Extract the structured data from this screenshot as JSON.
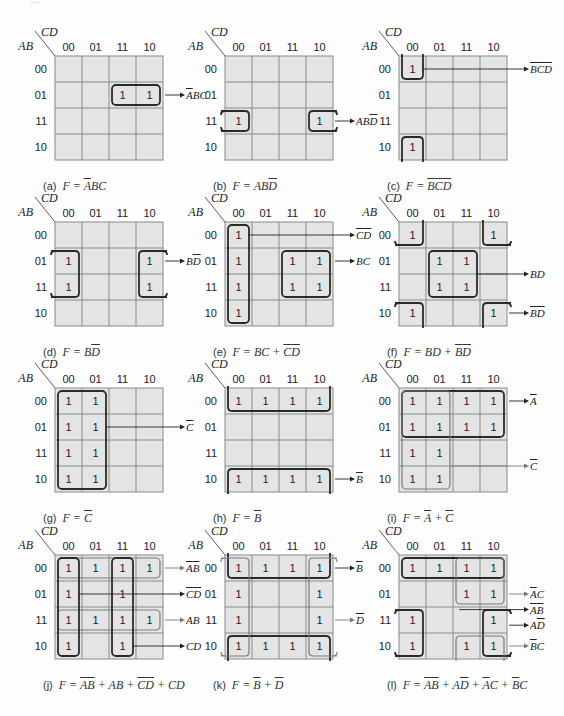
{
  "axis": {
    "row_var": "AB",
    "col_var": "CD",
    "gray_code": [
      "00",
      "01",
      "11",
      "10"
    ]
  },
  "colors": {
    "cell_fill": "#e4e4e4",
    "grid_line": "#8a8a8a",
    "loop_dark": "#2a2a2a",
    "loop_light": "#7a7a7a",
    "text": "#222222"
  },
  "layout": {
    "col_x": [
      55,
      225,
      399
    ],
    "row_y": [
      56,
      222,
      388,
      555
    ],
    "cell_w": 27,
    "cell_h": 26
  },
  "maps": [
    {
      "id": "a",
      "tag": "(a)",
      "caption": "F = [A]BC",
      "ones": [
        [
          1,
          2
        ],
        [
          1,
          3
        ]
      ],
      "loops": [
        {
          "r0": 1,
          "c0": 2,
          "r1": 1,
          "c1": 3,
          "style": "dark"
        }
      ],
      "terms": [
        {
          "label": "[A]BC",
          "ay": 1,
          "from": "right"
        }
      ]
    },
    {
      "id": "b",
      "tag": "(b)",
      "caption": "F = AB[D]",
      "ones": [
        [
          2,
          0
        ],
        [
          2,
          3
        ]
      ],
      "loops": [
        {
          "r0": 2,
          "c0": 0,
          "r1": 2,
          "c1": 0,
          "style": "dark",
          "openLeft": true
        },
        {
          "r0": 2,
          "c0": 3,
          "r1": 2,
          "c1": 3,
          "style": "dark",
          "openRight": true
        }
      ],
      "terms": [
        {
          "label": "AB[D]",
          "ay": 2,
          "from": "right"
        }
      ]
    },
    {
      "id": "c",
      "tag": "(c)",
      "caption": "F = [B][C][D]",
      "ones": [
        [
          0,
          0
        ],
        [
          3,
          0
        ]
      ],
      "loops": [
        {
          "r0": 0,
          "c0": 0,
          "r1": 0,
          "c1": 0,
          "style": "dark",
          "openTop": true
        },
        {
          "r0": 3,
          "c0": 0,
          "r1": 3,
          "c1": 0,
          "style": "dark",
          "openBottom": true
        }
      ],
      "terms": [
        {
          "label": "[B][C][D]",
          "ay": 0,
          "fromCol": 0
        }
      ]
    },
    {
      "id": "d",
      "tag": "(d)",
      "caption": "F = B[D]",
      "ones": [
        [
          1,
          0
        ],
        [
          2,
          0
        ],
        [
          1,
          3
        ],
        [
          2,
          3
        ]
      ],
      "loops": [
        {
          "r0": 1,
          "c0": 0,
          "r1": 2,
          "c1": 0,
          "style": "dark",
          "openLeft": true
        },
        {
          "r0": 1,
          "c0": 3,
          "r1": 2,
          "c1": 3,
          "style": "dark",
          "openRight": true
        }
      ],
      "terms": [
        {
          "label": "B[D]",
          "ay": 1,
          "from": "right"
        }
      ]
    },
    {
      "id": "e",
      "tag": "(e)",
      "caption": "F = BC + [C][D]",
      "ones": [
        [
          0,
          0
        ],
        [
          1,
          0
        ],
        [
          2,
          0
        ],
        [
          3,
          0
        ],
        [
          1,
          2
        ],
        [
          1,
          3
        ],
        [
          2,
          2
        ],
        [
          2,
          3
        ]
      ],
      "loops": [
        {
          "r0": 0,
          "c0": 0,
          "r1": 3,
          "c1": 0,
          "style": "dark"
        },
        {
          "r0": 1,
          "c0": 2,
          "r1": 2,
          "c1": 3,
          "style": "dark"
        }
      ],
      "terms": [
        {
          "label": "[C][D]",
          "ay": 0,
          "fromCol": 0
        },
        {
          "label": "BC",
          "ay": 1,
          "from": "right"
        }
      ]
    },
    {
      "id": "f",
      "tag": "(f)",
      "caption": "F = BD + [B][D]",
      "ones": [
        [
          0,
          0
        ],
        [
          0,
          3
        ],
        [
          1,
          1
        ],
        [
          1,
          2
        ],
        [
          2,
          1
        ],
        [
          2,
          2
        ],
        [
          3,
          0
        ],
        [
          3,
          3
        ]
      ],
      "loops": [
        {
          "r0": 0,
          "c0": 0,
          "r1": 0,
          "c1": 0,
          "style": "dark",
          "openLeft": true,
          "openTop": true
        },
        {
          "r0": 0,
          "c0": 3,
          "r1": 0,
          "c1": 3,
          "style": "dark",
          "openRight": true,
          "openTop": true
        },
        {
          "r0": 3,
          "c0": 0,
          "r1": 3,
          "c1": 0,
          "style": "dark",
          "openLeft": true,
          "openBottom": true
        },
        {
          "r0": 3,
          "c0": 3,
          "r1": 3,
          "c1": 3,
          "style": "dark",
          "openRight": true,
          "openBottom": true
        },
        {
          "r0": 1,
          "c0": 1,
          "r1": 2,
          "c1": 2,
          "style": "dark"
        }
      ],
      "terms": [
        {
          "label": "BD",
          "ay": 1.5,
          "from": "right",
          "fromX": 2
        },
        {
          "label": "[B][D]",
          "ay": 3,
          "from": "right"
        }
      ]
    },
    {
      "id": "g",
      "tag": "(g)",
      "caption": "F = [C]",
      "ones": [
        [
          0,
          0
        ],
        [
          0,
          1
        ],
        [
          1,
          0
        ],
        [
          1,
          1
        ],
        [
          2,
          0
        ],
        [
          2,
          1
        ],
        [
          3,
          0
        ],
        [
          3,
          1
        ]
      ],
      "loops": [
        {
          "r0": 0,
          "c0": 0,
          "r1": 3,
          "c1": 1,
          "style": "dark"
        }
      ],
      "terms": [
        {
          "label": "[C]",
          "ay": 1,
          "fromX": 1
        }
      ]
    },
    {
      "id": "h",
      "tag": "(h)",
      "caption": "F = [B]",
      "ones": [
        [
          0,
          0
        ],
        [
          0,
          1
        ],
        [
          0,
          2
        ],
        [
          0,
          3
        ],
        [
          3,
          0
        ],
        [
          3,
          1
        ],
        [
          3,
          2
        ],
        [
          3,
          3
        ]
      ],
      "loops": [
        {
          "r0": 0,
          "c0": 0,
          "r1": 0,
          "c1": 3,
          "style": "dark",
          "openTop": true
        },
        {
          "r0": 3,
          "c0": 0,
          "r1": 3,
          "c1": 3,
          "style": "dark",
          "openBottom": true
        }
      ],
      "terms": [
        {
          "label": "[B]",
          "ay": 3,
          "from": "right"
        }
      ]
    },
    {
      "id": "i",
      "tag": "(i)",
      "caption": "F = [A] + [C]",
      "ones": [
        [
          0,
          0
        ],
        [
          0,
          1
        ],
        [
          0,
          2
        ],
        [
          0,
          3
        ],
        [
          1,
          0
        ],
        [
          1,
          1
        ],
        [
          1,
          2
        ],
        [
          1,
          3
        ],
        [
          2,
          0
        ],
        [
          2,
          1
        ],
        [
          3,
          0
        ],
        [
          3,
          1
        ]
      ],
      "loops": [
        {
          "r0": 0,
          "c0": 0,
          "r1": 1,
          "c1": 3,
          "style": "dark"
        },
        {
          "r0": 0,
          "c0": 0,
          "r1": 3,
          "c1": 1,
          "style": "light"
        }
      ],
      "terms": [
        {
          "label": "[A]",
          "ay": 0,
          "from": "right"
        },
        {
          "label": "[C]",
          "ay": 2.5,
          "fromX": 1,
          "light": true
        }
      ]
    },
    {
      "id": "j",
      "tag": "(j)",
      "caption": "F = [A][B] + AB + [C][D] + CD",
      "ones": [
        [
          0,
          0
        ],
        [
          0,
          1
        ],
        [
          0,
          2
        ],
        [
          0,
          3
        ],
        [
          1,
          0
        ],
        [
          1,
          2
        ],
        [
          2,
          0
        ],
        [
          2,
          1
        ],
        [
          2,
          2
        ],
        [
          2,
          3
        ],
        [
          3,
          0
        ],
        [
          3,
          2
        ]
      ],
      "loops": [
        {
          "r0": 0,
          "c0": 0,
          "r1": 0,
          "c1": 3,
          "style": "light"
        },
        {
          "r0": 2,
          "c0": 0,
          "r1": 2,
          "c1": 3,
          "style": "light"
        },
        {
          "r0": 0,
          "c0": 0,
          "r1": 3,
          "c1": 0,
          "style": "dark"
        },
        {
          "r0": 0,
          "c0": 2,
          "r1": 3,
          "c1": 2,
          "style": "dark"
        }
      ],
      "terms": [
        {
          "label": "[A][B]",
          "ay": 0,
          "from": "right",
          "light": true
        },
        {
          "label": "[C][D]",
          "ay": 1,
          "fromCol": 0
        },
        {
          "label": "AB",
          "ay": 2,
          "from": "right",
          "light": true
        },
        {
          "label": "CD",
          "ay": 3,
          "fromCol": 2
        }
      ]
    },
    {
      "id": "k",
      "tag": "(k)",
      "caption": "F = [B] + [D]",
      "ones": [
        [
          0,
          0
        ],
        [
          0,
          1
        ],
        [
          0,
          2
        ],
        [
          0,
          3
        ],
        [
          1,
          0
        ],
        [
          1,
          3
        ],
        [
          2,
          0
        ],
        [
          2,
          3
        ],
        [
          3,
          0
        ],
        [
          3,
          1
        ],
        [
          3,
          2
        ],
        [
          3,
          3
        ]
      ],
      "loops": [
        {
          "r0": 0,
          "c0": 0,
          "r1": 0,
          "c1": 3,
          "style": "dark",
          "openTop": true
        },
        {
          "r0": 3,
          "c0": 0,
          "r1": 3,
          "c1": 3,
          "style": "dark",
          "openBottom": true
        },
        {
          "r0": 0,
          "c0": 0,
          "r1": 3,
          "c1": 0,
          "style": "light",
          "openLeft": true
        },
        {
          "r0": 0,
          "c0": 3,
          "r1": 3,
          "c1": 3,
          "style": "light",
          "openRight": true
        }
      ],
      "terms": [
        {
          "label": "[B]",
          "ay": 0,
          "from": "right"
        },
        {
          "label": "[D]",
          "ay": 2,
          "from": "right",
          "light": true
        }
      ]
    },
    {
      "id": "l",
      "tag": "(l)",
      "caption": "F = [A][B] + A[D] + [A]C + [B]C",
      "ones": [
        [
          0,
          0
        ],
        [
          0,
          1
        ],
        [
          0,
          2
        ],
        [
          0,
          3
        ],
        [
          1,
          2
        ],
        [
          1,
          3
        ],
        [
          2,
          0
        ],
        [
          2,
          3
        ],
        [
          3,
          0
        ],
        [
          3,
          2
        ],
        [
          3,
          3
        ]
      ],
      "loops": [
        {
          "r0": 0,
          "c0": 0,
          "r1": 0,
          "c1": 3,
          "style": "dark"
        },
        {
          "r0": 0,
          "c0": 2,
          "r1": 1,
          "c1": 3,
          "style": "light"
        },
        {
          "r0": 2,
          "c0": 0,
          "r1": 3,
          "c1": 0,
          "style": "dark",
          "openLeft": true
        },
        {
          "r0": 2,
          "c0": 3,
          "r1": 3,
          "c1": 3,
          "style": "dark",
          "openRight": true
        },
        {
          "r0": 3,
          "c0": 2,
          "r1": 3,
          "c1": 3,
          "style": "light",
          "openBottom": true
        }
      ],
      "terms": [
        {
          "label": "[A]C",
          "ay": 1,
          "from": "right",
          "light": true
        },
        {
          "label": "[A][B]",
          "ay": 1.6,
          "fromX": 1.3
        },
        {
          "label": "A[D]",
          "ay": 2.2,
          "from": "right"
        },
        {
          "label": "[B]C",
          "ay": 3,
          "from": "right",
          "light": true
        }
      ]
    }
  ],
  "top_text_partial": "…"
}
